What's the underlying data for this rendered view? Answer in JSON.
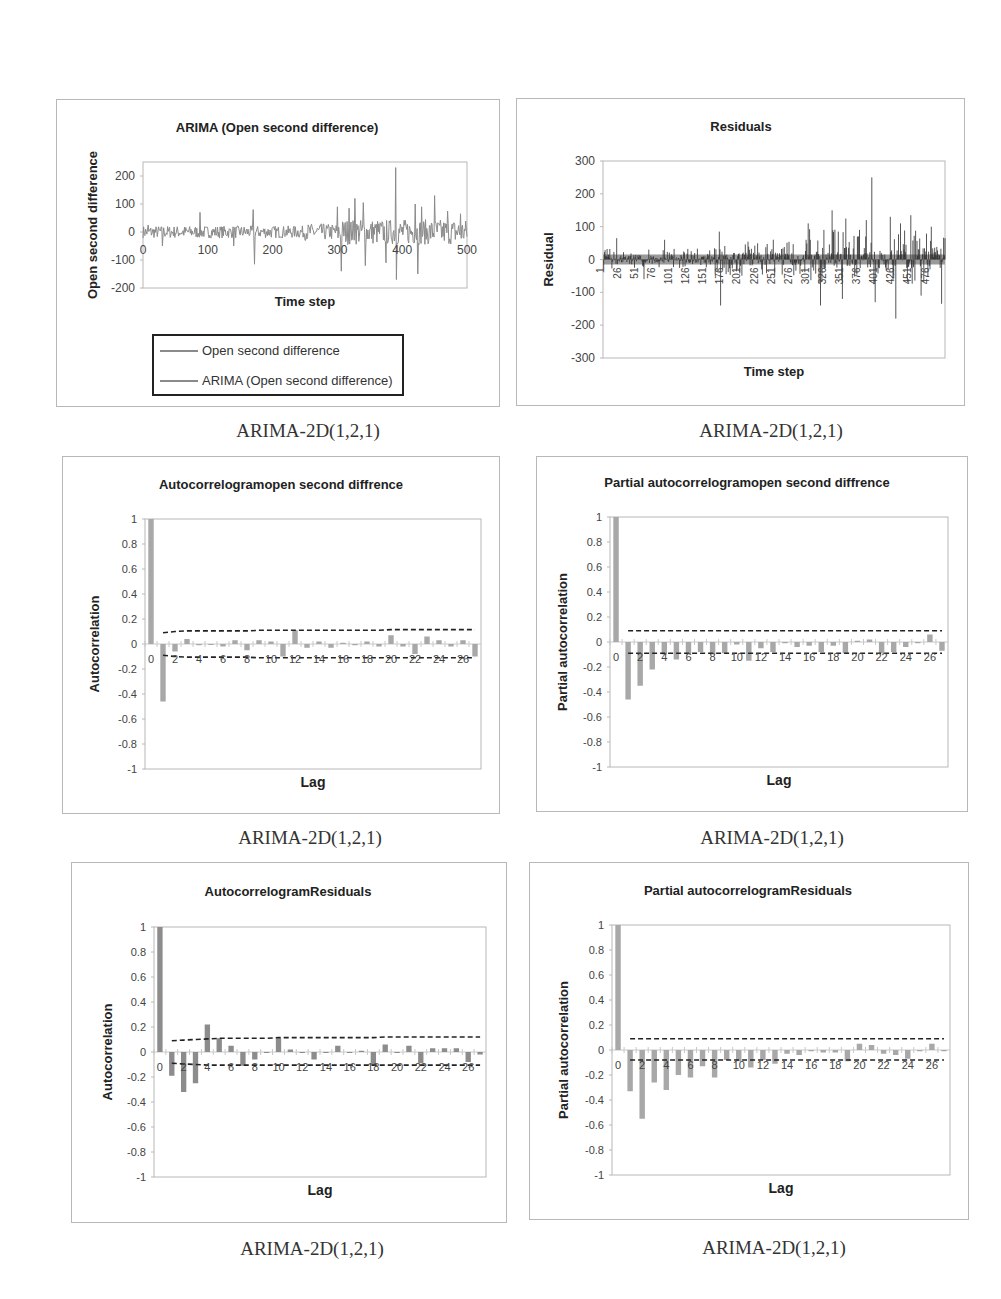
{
  "captions": [
    "ARIMA-2D(1,2,1)",
    "ARIMA-2D(1,2,1)",
    "ARIMA-2D(1,2,1)",
    "ARIMA-2D(1,2,1)",
    "ARIMA-2D(1,2,1)",
    "ARIMA-2D(1,2,1)"
  ],
  "colors": {
    "series": "#8a8a8a",
    "residual_bar": "#2a2a2a",
    "residual_band": "#9a9a9a",
    "acf_bar": "#a8a8a8",
    "conf_line": "#222222",
    "frame": "#b8b8b8"
  },
  "chart_data": [
    {
      "id": "series",
      "type": "line",
      "title": "ARIMA (Open second difference)",
      "xlabel": "Time step",
      "ylabel": "Open second difference",
      "xlim": [
        0,
        500
      ],
      "ylim": [
        -200,
        250
      ],
      "xticks": [
        "0",
        "100",
        "200",
        "300",
        "400",
        "500"
      ],
      "yticks": [
        "200",
        "100",
        "0",
        "-100",
        "-200"
      ],
      "legend": [
        "Open second difference",
        "ARIMA (Open second difference)"
      ],
      "legend_position": "bottom",
      "series": [
        {
          "name": "Open second difference",
          "approx_spikes": [
            [
              8,
              25
            ],
            [
              30,
              55
            ],
            [
              30,
              -50
            ],
            [
              88,
              70
            ],
            [
              140,
              -50
            ],
            [
              170,
              80
            ],
            [
              172,
              -115
            ],
            [
              300,
              90
            ],
            [
              306,
              -140
            ],
            [
              318,
              85
            ],
            [
              327,
              120
            ],
            [
              340,
              105
            ],
            [
              343,
              -120
            ],
            [
              375,
              -110
            ],
            [
              390,
              230
            ],
            [
              391,
              -170
            ],
            [
              420,
              100
            ],
            [
              424,
              -150
            ],
            [
              430,
              90
            ],
            [
              450,
              130
            ],
            [
              470,
              75
            ],
            [
              490,
              65
            ]
          ]
        },
        {
          "name": "ARIMA (Open second difference)",
          "approx_spikes": []
        }
      ]
    },
    {
      "id": "residuals",
      "type": "bar",
      "title": "Residuals",
      "xlabel": "Time step",
      "ylabel": "Residual",
      "ylim": [
        -300,
        300
      ],
      "yticks": [
        "300",
        "200",
        "100",
        "0",
        "-100",
        "-200",
        "-300"
      ],
      "xticks": [
        "1",
        "26",
        "51",
        "76",
        "101",
        "126",
        "151",
        "176",
        "201",
        "226",
        "251",
        "276",
        "301",
        "326",
        "351",
        "376",
        "401",
        "426",
        "451",
        "476"
      ],
      "approx_spikes": [
        [
          20,
          65
        ],
        [
          60,
          -60
        ],
        [
          90,
          60
        ],
        [
          170,
          85
        ],
        [
          172,
          -140
        ],
        [
          300,
          110
        ],
        [
          318,
          -140
        ],
        [
          335,
          150
        ],
        [
          350,
          -120
        ],
        [
          355,
          125
        ],
        [
          375,
          90
        ],
        [
          385,
          120
        ],
        [
          393,
          250
        ],
        [
          398,
          -130
        ],
        [
          420,
          130
        ],
        [
          428,
          -180
        ],
        [
          435,
          110
        ],
        [
          450,
          135
        ],
        [
          465,
          -110
        ],
        [
          480,
          100
        ],
        [
          495,
          -135
        ],
        [
          500,
          65
        ]
      ]
    },
    {
      "id": "acf_series",
      "type": "bar",
      "title": "Autocorrelogramopen second diffrence",
      "xlabel": "Lag",
      "ylabel": "Autocorrelation",
      "ylim": [
        -1,
        1
      ],
      "yticks": [
        "1",
        "0.8",
        "0.6",
        "0.4",
        "0.2",
        "0",
        "-0.2",
        "-0.4",
        "-0.6",
        "-0.8",
        "-1"
      ],
      "xticks": [
        "0",
        "2",
        "4",
        "6",
        "8",
        "10",
        "12",
        "14",
        "16",
        "18",
        "20",
        "22",
        "24",
        "26"
      ],
      "lags": [
        0,
        1,
        2,
        3,
        4,
        5,
        6,
        7,
        8,
        9,
        10,
        11,
        12,
        13,
        14,
        15,
        16,
        17,
        18,
        19,
        20,
        21,
        22,
        23,
        24,
        25,
        26,
        27
      ],
      "values": [
        1.0,
        -0.46,
        -0.06,
        0.04,
        -0.01,
        0.0,
        -0.02,
        0.03,
        -0.05,
        0.03,
        0.02,
        -0.1,
        0.11,
        -0.03,
        0.02,
        -0.03,
        0.01,
        -0.01,
        0.02,
        -0.02,
        0.07,
        -0.02,
        -0.08,
        0.06,
        0.03,
        -0.02,
        0.03,
        -0.1
      ],
      "conf_upper": [
        null,
        0.09,
        0.1,
        0.105,
        0.105,
        0.105,
        0.105,
        0.105,
        0.105,
        0.11,
        0.11,
        0.11,
        0.11,
        0.11,
        0.11,
        0.11,
        0.11,
        0.11,
        0.11,
        0.11,
        0.115,
        0.115,
        0.115,
        0.115,
        0.115,
        0.115,
        0.115,
        0.115
      ],
      "conf_lower": [
        null,
        -0.09,
        -0.1,
        -0.105,
        -0.105,
        -0.105,
        -0.105,
        -0.105,
        -0.105,
        -0.11,
        -0.11,
        -0.11,
        -0.11,
        -0.11,
        -0.11,
        -0.11,
        -0.11,
        -0.11,
        -0.11,
        -0.11,
        -0.11,
        -0.11,
        -0.11,
        -0.11,
        -0.11,
        -0.11,
        -0.11,
        -0.11
      ]
    },
    {
      "id": "pacf_series",
      "type": "bar",
      "title": "Partial autocorrelogramopen second diffrence",
      "xlabel": "Lag",
      "ylabel": "Partial autocorrelation",
      "ylim": [
        -1,
        1
      ],
      "yticks": [
        "1",
        "0.8",
        "0.6",
        "0.4",
        "0.2",
        "0",
        "-0.2",
        "-0.4",
        "-0.6",
        "-0.8",
        "-1"
      ],
      "xticks": [
        "0",
        "2",
        "4",
        "6",
        "8",
        "10",
        "12",
        "14",
        "16",
        "18",
        "20",
        "22",
        "24",
        "26"
      ],
      "lags": [
        0,
        1,
        2,
        3,
        4,
        5,
        6,
        7,
        8,
        9,
        10,
        11,
        12,
        13,
        14,
        15,
        16,
        17,
        18,
        19,
        20,
        21,
        22,
        23,
        24,
        25,
        26,
        27
      ],
      "values": [
        1.0,
        -0.46,
        -0.35,
        -0.22,
        -0.1,
        -0.14,
        -0.1,
        -0.08,
        -0.1,
        -0.09,
        -0.02,
        -0.15,
        -0.05,
        -0.08,
        -0.01,
        -0.04,
        -0.03,
        -0.08,
        -0.03,
        -0.09,
        0.01,
        0.02,
        -0.09,
        -0.08,
        -0.04,
        -0.01,
        0.06,
        -0.07
      ],
      "conf_upper": 0.09,
      "conf_lower": -0.09
    },
    {
      "id": "acf_residuals",
      "type": "bar",
      "title": "AutocorrelogramResiduals",
      "xlabel": "Lag",
      "ylabel": "Autocorrelation",
      "ylim": [
        -1,
        1
      ],
      "yticks": [
        "1",
        "0.8",
        "0.6",
        "0.4",
        "0.2",
        "0",
        "-0.2",
        "-0.4",
        "-0.6",
        "-0.8",
        "-1"
      ],
      "xticks": [
        "0",
        "2",
        "4",
        "6",
        "8",
        "10",
        "12",
        "14",
        "16",
        "18",
        "20",
        "22",
        "24",
        "26"
      ],
      "lags": [
        0,
        1,
        2,
        3,
        4,
        5,
        6,
        7,
        8,
        9,
        10,
        11,
        12,
        13,
        14,
        15,
        16,
        17,
        18,
        19,
        20,
        21,
        22,
        23,
        24,
        25,
        26,
        27
      ],
      "values": [
        1.0,
        -0.19,
        -0.32,
        -0.25,
        0.22,
        0.11,
        0.05,
        -0.11,
        -0.06,
        0.0,
        0.11,
        0.02,
        0.0,
        -0.06,
        0.0,
        0.05,
        0.0,
        0.01,
        -0.11,
        0.06,
        0.0,
        0.05,
        -0.09,
        0.03,
        0.03,
        0.03,
        -0.08,
        -0.02
      ],
      "conf_upper": [
        null,
        0.09,
        0.095,
        0.1,
        0.105,
        0.11,
        0.11,
        0.11,
        0.11,
        0.11,
        0.115,
        0.115,
        0.115,
        0.115,
        0.115,
        0.115,
        0.115,
        0.115,
        0.115,
        0.12,
        0.12,
        0.12,
        0.12,
        0.12,
        0.12,
        0.12,
        0.12,
        0.12
      ],
      "conf_lower": [
        null,
        -0.09,
        -0.095,
        -0.1,
        -0.105,
        -0.105,
        -0.105,
        -0.105,
        -0.105,
        -0.105,
        -0.105,
        -0.105,
        -0.105,
        -0.105,
        -0.105,
        -0.105,
        -0.105,
        -0.105,
        -0.105,
        -0.105,
        -0.105,
        -0.105,
        -0.105,
        -0.105,
        -0.105,
        -0.105,
        -0.105,
        -0.105
      ]
    },
    {
      "id": "pacf_residuals",
      "type": "bar",
      "title": "Partial autocorrelogramResiduals",
      "xlabel": "Lag",
      "ylabel": "Partial autocorrelation",
      "ylim": [
        -1,
        1
      ],
      "yticks": [
        "1",
        "0.8",
        "0.6",
        "0.4",
        "0.2",
        "0",
        "-0.2",
        "-0.4",
        "-0.6",
        "-0.8",
        "-1"
      ],
      "xticks": [
        "0",
        "2",
        "4",
        "6",
        "8",
        "10",
        "12",
        "14",
        "16",
        "18",
        "20",
        "22",
        "24",
        "26"
      ],
      "lags": [
        0,
        1,
        2,
        3,
        4,
        5,
        6,
        7,
        8,
        9,
        10,
        11,
        12,
        13,
        14,
        15,
        16,
        17,
        18,
        19,
        20,
        21,
        22,
        23,
        24,
        25,
        26,
        27
      ],
      "values": [
        1.0,
        -0.33,
        -0.55,
        -0.26,
        -0.32,
        -0.2,
        -0.22,
        -0.13,
        -0.22,
        -0.08,
        -0.09,
        -0.14,
        -0.08,
        -0.11,
        -0.03,
        -0.04,
        -0.01,
        -0.02,
        -0.02,
        -0.09,
        0.05,
        0.04,
        -0.03,
        -0.04,
        -0.07,
        -0.01,
        0.05,
        -0.01
      ],
      "conf_upper": 0.09,
      "conf_lower": -0.08
    }
  ]
}
